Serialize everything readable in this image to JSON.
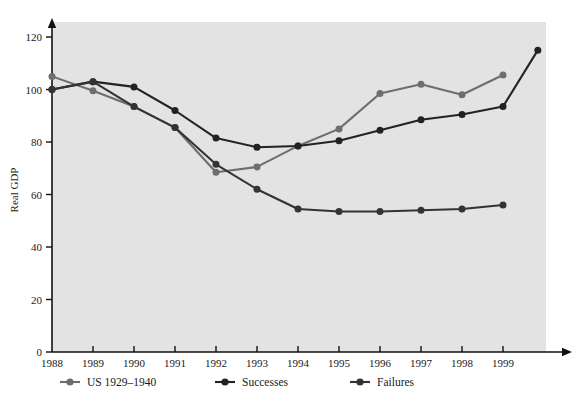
{
  "chart_data": {
    "type": "line",
    "title": "",
    "xlabel": "",
    "ylabel": "Real GDP",
    "x": [
      1988,
      1989,
      1990,
      1991,
      1992,
      1993,
      1994,
      1995,
      1996,
      1997,
      1998,
      1999
    ],
    "categories": [
      "1988",
      "1989",
      "1990",
      "1991",
      "1992",
      "1993",
      "1994",
      "1995",
      "1996",
      "1997",
      "1998",
      "1999"
    ],
    "xlim": [
      1988,
      1999.9
    ],
    "ylim": [
      0,
      128
    ],
    "yticks": [
      0,
      20,
      40,
      60,
      80,
      100,
      120
    ],
    "ytick_labels": [
      "0",
      "20",
      "40",
      "60",
      "80",
      "100",
      "120"
    ],
    "xtick_labels": [
      "1988",
      "1989",
      "1990",
      "1991",
      "1992",
      "1993",
      "1994",
      "1995",
      "1996",
      "1997",
      "1998",
      "1999"
    ],
    "grid": false,
    "legend_position": "bottom-center",
    "plot_background": "#e3e3e3",
    "page_background": "#ffffff",
    "series": [
      {
        "name": "US 1929–1940",
        "color": "#6e6e6e",
        "marker": "circle",
        "values": [
          105,
          99.5,
          93.5,
          85.5,
          68.5,
          70.5,
          78.5,
          85,
          98.5,
          102,
          98,
          105.5
        ]
      },
      {
        "name": "Successes",
        "color": "#222222",
        "marker": "circle",
        "values": [
          100,
          103,
          101,
          92,
          81.5,
          78,
          78.5,
          80.5,
          84.5,
          88.5,
          90.5,
          93.5
        ],
        "extra_point": {
          "x": 1999.85,
          "y": 115
        }
      },
      {
        "name": "Failures",
        "color": "#333333",
        "marker": "circle",
        "values": [
          100,
          103,
          93.5,
          85.5,
          71.5,
          62,
          54.5,
          53.5,
          53.5,
          54,
          54.5,
          56
        ]
      }
    ]
  },
  "legend": {
    "items": [
      {
        "label": "US 1929–1940",
        "color": "#6e6e6e"
      },
      {
        "label": "Successes",
        "color": "#222222"
      },
      {
        "label": "Failures",
        "color": "#333333"
      }
    ]
  },
  "axis": {
    "y_title": "Real GDP"
  }
}
